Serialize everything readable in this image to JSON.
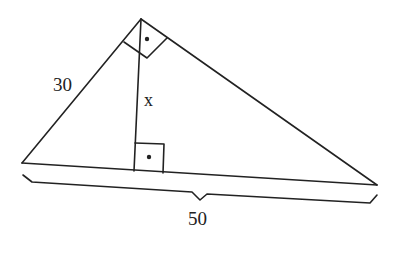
{
  "diagram": {
    "type": "right-triangle-altitude",
    "labels": {
      "leg": "30",
      "altitude": "x",
      "hypotenuse": "50"
    },
    "colors": {
      "stroke": "#222222",
      "background": "#ffffff"
    }
  }
}
